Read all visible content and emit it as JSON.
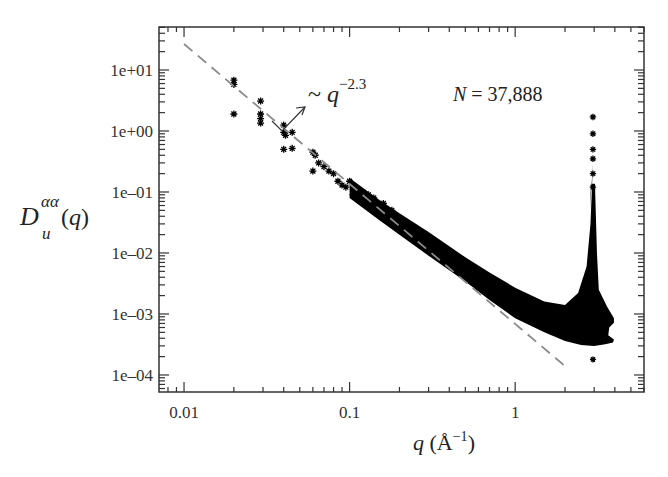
{
  "chart_data": {
    "type": "scatter",
    "title": "",
    "xlabel": "q (Å^-1)",
    "ylabel": "D_u^αα(q)",
    "xscale": "log",
    "yscale": "log",
    "xlim": [
      0.00706,
      6.0
    ],
    "ylim": [
      5.26e-05,
      50.7
    ],
    "grid": false,
    "legend": null,
    "x_ticks": [
      {
        "value": 0.01,
        "label": "0.01"
      },
      {
        "value": 0.1,
        "label": "0.1"
      },
      {
        "value": 1,
        "label": "1"
      }
    ],
    "y_ticks": [
      {
        "value": 10,
        "label": "1e+01"
      },
      {
        "value": 1,
        "label": "1e+00"
      },
      {
        "value": 0.1,
        "label": "1e–01"
      },
      {
        "value": 0.01,
        "label": "1e–02"
      },
      {
        "value": 0.001,
        "label": "1e–03"
      },
      {
        "value": 0.0001,
        "label": "1e–04"
      }
    ],
    "annotations": [
      {
        "text_prefix": "~ q",
        "superscript": "−2.3",
        "description": "power-law fit ~ q^-2.3"
      },
      {
        "text_prefix": "N",
        "text_suffix": " = 37,888",
        "description": "number of atoms"
      }
    ],
    "fit_line": {
      "style": "dashed",
      "color": "#888888",
      "exponent": -2.3,
      "x": [
        0.01,
        2.0
      ],
      "y": [
        26.7,
        0.00014
      ]
    },
    "series": [
      {
        "name": "D_u^αα(q) (scattered low-q points)",
        "marker": "+/x/*",
        "color": "#000000",
        "x": [
          0.02,
          0.02,
          0.02,
          0.029,
          0.029,
          0.029,
          0.029,
          0.04,
          0.04,
          0.04,
          0.041,
          0.045,
          0.045,
          0.06,
          0.06,
          0.062,
          0.065,
          0.07,
          0.075,
          0.08,
          0.085,
          0.09
        ],
        "y": [
          6.8,
          5.8,
          1.9,
          3.1,
          1.9,
          1.6,
          1.35,
          1.25,
          0.95,
          0.5,
          0.85,
          0.95,
          0.52,
          0.45,
          0.22,
          0.4,
          0.3,
          0.26,
          0.22,
          0.2,
          0.15,
          0.13
        ]
      },
      {
        "name": "D_u^αα(q) (dense band, envelope)",
        "marker": "*",
        "color": "#000000",
        "band_upper": {
          "x": [
            0.1,
            0.15,
            0.2,
            0.3,
            0.5,
            0.7,
            1.0,
            1.5,
            2.0,
            2.4,
            2.7,
            2.85,
            2.95
          ],
          "y": [
            0.17,
            0.075,
            0.045,
            0.022,
            0.0085,
            0.0048,
            0.0027,
            0.0016,
            0.0014,
            0.0022,
            0.006,
            0.03,
            0.3
          ]
        },
        "band_lower": {
          "x": [
            0.1,
            0.15,
            0.2,
            0.3,
            0.5,
            0.7,
            1.0,
            1.5,
            2.0,
            2.5,
            3.0,
            3.5,
            3.9
          ],
          "y": [
            0.08,
            0.035,
            0.02,
            0.009,
            0.0034,
            0.0017,
            0.00085,
            0.0005,
            0.00036,
            0.00031,
            0.0003,
            0.00032,
            0.00034
          ]
        },
        "peak": {
          "x": 2.95,
          "y_max": 1.7,
          "y_min": 0.00018
        }
      }
    ]
  },
  "labels": {
    "ylabel_main": "D",
    "ylabel_sup": "αα",
    "ylabel_sub": "u",
    "ylabel_tail": "(q)",
    "xlabel_q": "q",
    "xlabel_unit": " (Å",
    "xlabel_exp": "−1",
    "xlabel_close": ")",
    "fit_prefix": "~ ",
    "fit_q": "q",
    "fit_exp": "−2.3",
    "n_label": "N",
    "n_value": " = 37,888"
  },
  "style": {
    "frame_color": "#333333",
    "point_color": "#000000",
    "fit_color": "#8a8a8a",
    "background": "#ffffff"
  }
}
